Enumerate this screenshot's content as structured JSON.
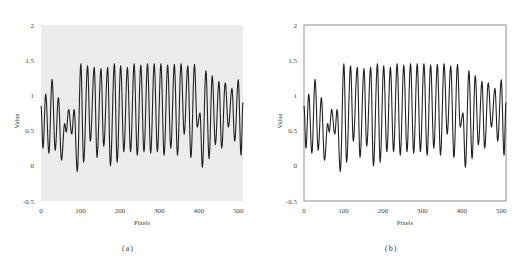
{
  "figure": {
    "panels": [
      {
        "id": "a",
        "caption": "(a)",
        "background": "#ececec",
        "frame": false
      },
      {
        "id": "b",
        "caption": "(b)",
        "background": "#ffffff",
        "frame": true
      }
    ]
  },
  "chart_data": [
    {
      "type": "line",
      "title": "",
      "caption": "(a)",
      "xlabel": "Pixels",
      "ylabel": "Value",
      "xlim": [
        0,
        512
      ],
      "ylim": [
        -0.5,
        2
      ],
      "xticks": [
        0,
        100,
        200,
        300,
        400,
        500
      ],
      "yticks": [
        -0.5,
        0,
        0.5,
        1,
        1.5,
        2
      ],
      "ytick_labels": [
        "-0.5",
        "0",
        "0.5",
        "1",
        "1.5",
        "2"
      ],
      "grid": false,
      "legend": null,
      "plot_background": "#ececec",
      "line_color": "#222222",
      "series": [
        {
          "name": "signal",
          "extrema_x": [
            0,
            5,
            12,
            20,
            28,
            36,
            44,
            52,
            60,
            64,
            70,
            78,
            84,
            92,
            101,
            108,
            118,
            125,
            135,
            142,
            152,
            159,
            169,
            176,
            186,
            193,
            202,
            210,
            219,
            227,
            236,
            244,
            253,
            261,
            270,
            278,
            287,
            295,
            304,
            312,
            321,
            329,
            338,
            346,
            355,
            363,
            372,
            380,
            389,
            396,
            403,
            409,
            418,
            426,
            434,
            442,
            451,
            458,
            467,
            475,
            484,
            491,
            500,
            507,
            512
          ],
          "extrema_y": [
            0.85,
            0.25,
            1.02,
            0.18,
            1.23,
            0.22,
            0.97,
            0.08,
            0.6,
            0.48,
            0.8,
            0.45,
            0.8,
            -0.08,
            1.45,
            0.05,
            1.42,
            0.35,
            1.4,
            0.12,
            1.38,
            0.28,
            1.4,
            0.0,
            1.45,
            0.05,
            1.42,
            0.2,
            1.4,
            0.2,
            1.45,
            0.15,
            1.43,
            0.2,
            1.45,
            0.18,
            1.45,
            0.2,
            1.45,
            0.15,
            1.43,
            0.25,
            1.44,
            0.15,
            1.45,
            0.45,
            1.42,
            0.12,
            1.44,
            0.55,
            0.75,
            -0.02,
            1.35,
            0.1,
            1.28,
            0.3,
            1.2,
            0.25,
            1.18,
            0.55,
            1.1,
            0.35,
            1.22,
            0.15,
            0.9
          ]
        }
      ]
    },
    {
      "type": "line",
      "title": "",
      "caption": "(b)",
      "xlabel": "Pixels",
      "ylabel": "Value",
      "xlim": [
        0,
        512
      ],
      "ylim": [
        -0.5,
        2
      ],
      "xticks": [
        0,
        100,
        200,
        300,
        400,
        500
      ],
      "yticks": [
        -0.5,
        0,
        0.5,
        1,
        1.5,
        2
      ],
      "ytick_labels": [
        "-0.5",
        "0",
        "0.5",
        "1",
        "1.5",
        "2"
      ],
      "grid": false,
      "legend": null,
      "plot_background": "#ffffff",
      "line_color": "#222222",
      "series": [
        {
          "name": "signal",
          "extrema_x": [
            0,
            5,
            12,
            20,
            28,
            36,
            44,
            52,
            60,
            64,
            70,
            78,
            84,
            92,
            101,
            108,
            118,
            125,
            135,
            142,
            152,
            159,
            169,
            176,
            186,
            193,
            202,
            210,
            219,
            227,
            236,
            244,
            253,
            261,
            270,
            278,
            287,
            295,
            304,
            312,
            321,
            329,
            338,
            346,
            355,
            363,
            372,
            380,
            389,
            396,
            403,
            409,
            418,
            426,
            434,
            442,
            451,
            458,
            467,
            475,
            484,
            491,
            500,
            507,
            512
          ],
          "extrema_y": [
            0.85,
            0.25,
            1.02,
            0.18,
            1.23,
            0.22,
            0.97,
            0.08,
            0.6,
            0.48,
            0.8,
            0.45,
            0.8,
            -0.08,
            1.45,
            0.05,
            1.42,
            0.35,
            1.4,
            0.12,
            1.38,
            0.28,
            1.4,
            0.0,
            1.45,
            0.05,
            1.42,
            0.2,
            1.4,
            0.2,
            1.45,
            0.15,
            1.43,
            0.2,
            1.45,
            0.18,
            1.45,
            0.2,
            1.45,
            0.15,
            1.43,
            0.25,
            1.44,
            0.15,
            1.45,
            0.45,
            1.42,
            0.12,
            1.44,
            0.55,
            0.75,
            -0.02,
            1.35,
            0.1,
            1.28,
            0.3,
            1.2,
            0.25,
            1.18,
            0.55,
            1.1,
            0.35,
            1.22,
            0.15,
            0.9
          ]
        }
      ]
    }
  ]
}
